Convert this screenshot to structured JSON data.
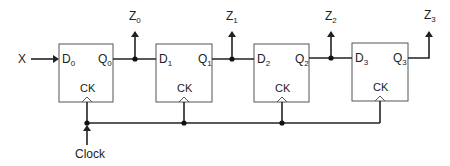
{
  "diagram": {
    "type": "shift-register",
    "colors": {
      "line": "#222222",
      "box": "#555555",
      "background": "#ffffff"
    },
    "input": {
      "label": "X"
    },
    "clock": {
      "label": "Clock"
    },
    "flipflops": [
      {
        "d": "D",
        "d_sub": "0",
        "q": "Q",
        "q_sub": "0",
        "ck": "CK"
      },
      {
        "d": "D",
        "d_sub": "1",
        "q": "Q",
        "q_sub": "1",
        "ck": "CK"
      },
      {
        "d": "D",
        "d_sub": "2",
        "q": "Q",
        "q_sub": "2",
        "ck": "CK"
      },
      {
        "d": "D",
        "d_sub": "3",
        "q": "Q",
        "q_sub": "3",
        "ck": "CK"
      }
    ],
    "outputs": [
      {
        "z": "Z",
        "z_sub": "0"
      },
      {
        "z": "Z",
        "z_sub": "1"
      },
      {
        "z": "Z",
        "z_sub": "2"
      },
      {
        "z": "Z",
        "z_sub": "3"
      }
    ]
  }
}
